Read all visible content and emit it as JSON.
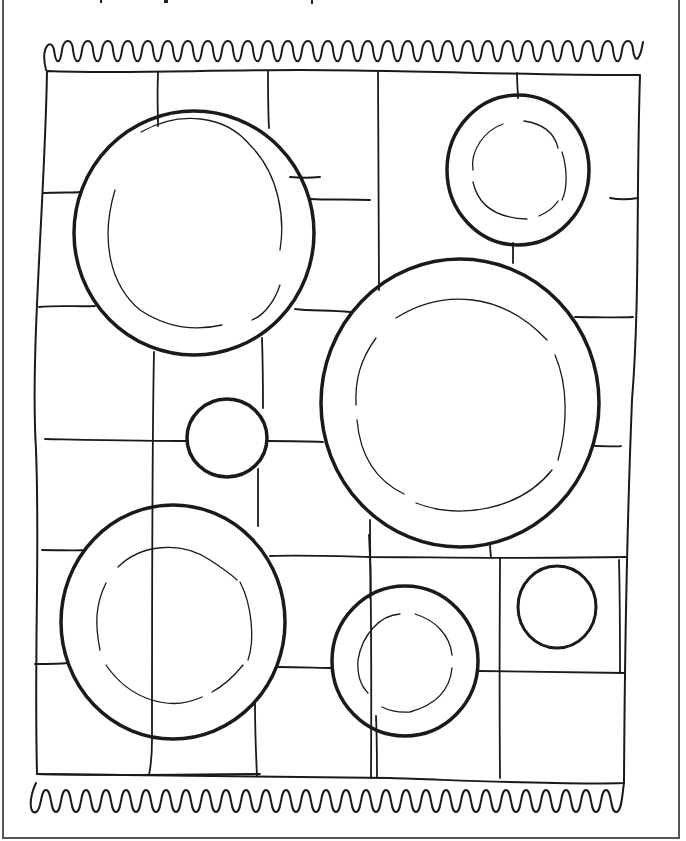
{
  "page": {
    "title": ""
  },
  "colors": {
    "line": "#1a1a1a",
    "background": "#ffffff",
    "frame": "#555555"
  },
  "blanket": {
    "fringe_top_y": 45,
    "fringe_bottom_y": 800,
    "left": 44,
    "right": 640,
    "top": 65,
    "bottom": 790
  },
  "plates": [
    {
      "name": "large-plate-top-left",
      "cx": 194,
      "cy": 233,
      "r": 120,
      "inner_r": 88,
      "rim": true
    },
    {
      "name": "small-plate-top-right",
      "cx": 518,
      "cy": 170,
      "r": 72,
      "inner_r": 47,
      "rim": true
    },
    {
      "name": "large-plate-center-right",
      "cx": 460,
      "cy": 403,
      "r": 140,
      "inner_r": 105,
      "rim": true
    },
    {
      "name": "small-bowl-center",
      "cx": 227,
      "cy": 438,
      "r": 40,
      "inner_r": 0,
      "rim": false
    },
    {
      "name": "large-plate-bottom-left",
      "cx": 173,
      "cy": 622,
      "r": 112,
      "inner_r": 78,
      "rim": true
    },
    {
      "name": "medium-plate-bottom-center",
      "cx": 405,
      "cy": 661,
      "r": 73,
      "inner_r": 48,
      "rim": true
    },
    {
      "name": "small-bowl-bottom-right",
      "cx": 557,
      "cy": 607,
      "r": 39,
      "inner_r": 0,
      "rim": false
    }
  ]
}
